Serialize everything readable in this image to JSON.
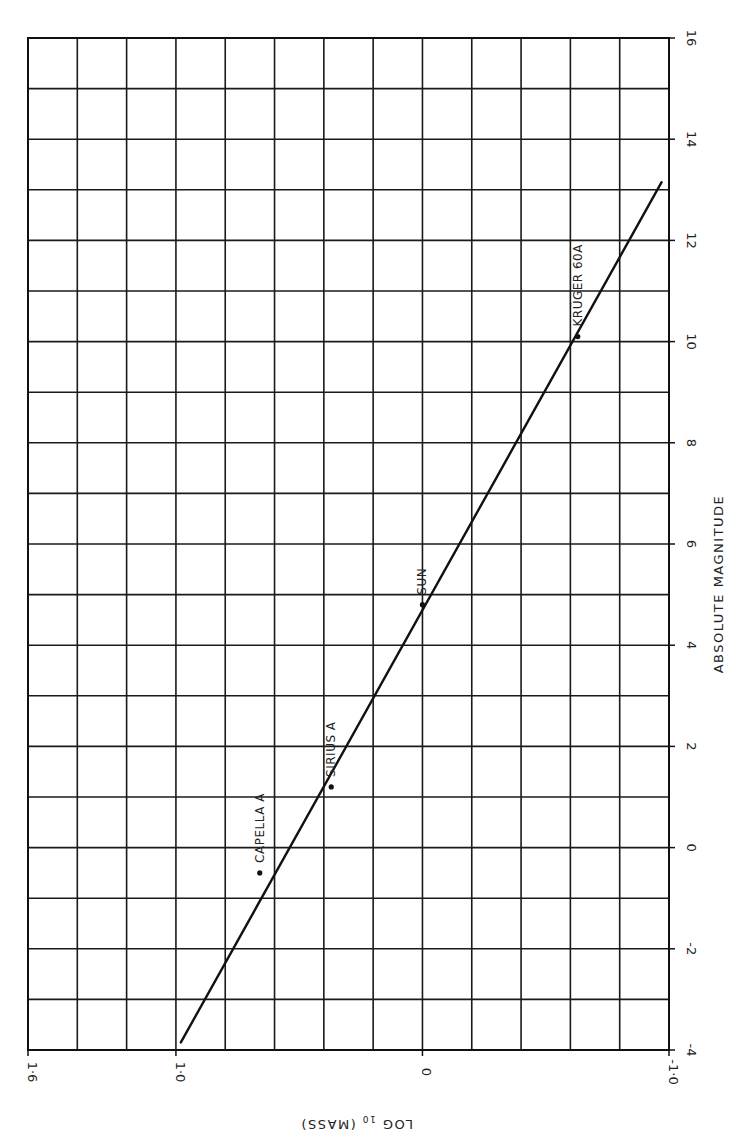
{
  "chart_data": {
    "type": "scatter",
    "title": "",
    "orientation": "rotated 90 degrees (x-axis runs vertically along right edge, y-axis runs horizontally along bottom edge, upside-down)",
    "xlabel": "ABSOLUTE MAGNITUDE",
    "ylabel": "LOG10 (MASS)",
    "ylabel_display": "LOG 10 (MASS)",
    "xlim": [
      -4,
      16
    ],
    "ylim": [
      -1.0,
      1.6
    ],
    "x_ticks": [
      "-4",
      "-2",
      "0",
      "2",
      "4",
      "6",
      "8",
      "10",
      "12",
      "14",
      "16"
    ],
    "x_tick_values": [
      -4,
      -2,
      0,
      2,
      4,
      6,
      8,
      10,
      12,
      14,
      16
    ],
    "y_ticks": [
      "1·6",
      "1·0",
      "0",
      "-1·0"
    ],
    "y_tick_values": [
      1.6,
      1.0,
      0,
      -1.0
    ],
    "grid": true,
    "grid_x_step": 1,
    "grid_y_step": 0.2,
    "legend": null,
    "series": [
      {
        "name": "stars",
        "kind": "points",
        "points": [
          {
            "label": "CAPELLA A",
            "x": -0.5,
            "y": 0.66
          },
          {
            "label": "SIRIUS A",
            "x": 1.2,
            "y": 0.37
          },
          {
            "label": "SUN",
            "x": 4.8,
            "y": 0.0
          },
          {
            "label": "KRÜGER 60A",
            "x": 10.1,
            "y": -0.63
          }
        ]
      },
      {
        "name": "mass-luminosity fit",
        "kind": "line",
        "points": [
          {
            "x": -3.85,
            "y": 0.98
          },
          {
            "x": 13.15,
            "y": -0.97
          }
        ]
      }
    ]
  },
  "labels": {
    "x_axis_title": "ABSOLUTE MAGNITUDE",
    "y_axis_title": "LOG 10 (MASS)",
    "y_axis_title_main": "LOG",
    "y_axis_title_sub": "10",
    "y_axis_title_rest": "(MASS)"
  }
}
